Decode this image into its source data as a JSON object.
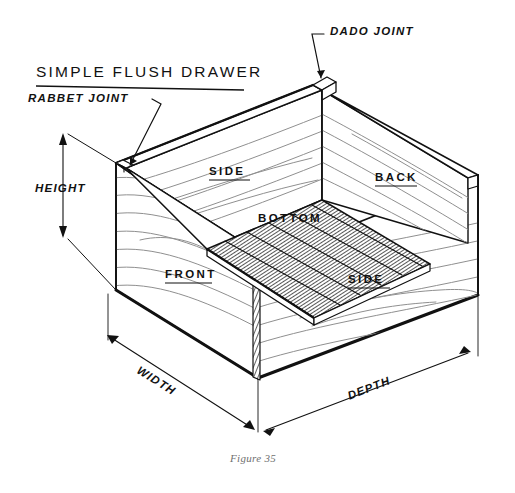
{
  "figure": {
    "title": "SIMPLE FLUSH DRAWER",
    "caption": "Figure 35"
  },
  "callouts": [
    {
      "id": "dado",
      "label": "DADO JOINT"
    },
    {
      "id": "rabbet",
      "label": "RABBET JOINT"
    }
  ],
  "parts": [
    {
      "id": "side-left",
      "label": "SIDE"
    },
    {
      "id": "back",
      "label": "BACK"
    },
    {
      "id": "bottom",
      "label": "BOTTOM"
    },
    {
      "id": "front",
      "label": "FRONT"
    },
    {
      "id": "side-right",
      "label": "SIDE"
    }
  ],
  "dimensions": [
    {
      "id": "height",
      "label": "HEIGHT"
    },
    {
      "id": "width",
      "label": "WIDTH"
    },
    {
      "id": "depth",
      "label": "DEPTH"
    }
  ],
  "colors": {
    "ink": "#111111",
    "grain": "#8a8a8a",
    "hatch": "#333333",
    "caption": "#6f6f6f",
    "paper": "#ffffff"
  }
}
